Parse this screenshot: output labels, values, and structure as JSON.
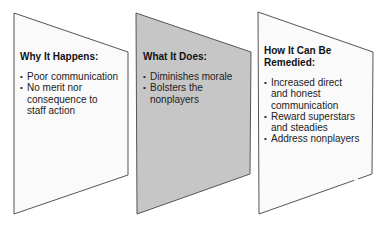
{
  "diagram": {
    "colors": {
      "panel_light_fill": "#fafafa",
      "panel_dark_fill": "#c6c6c6",
      "outline": "#555555"
    },
    "panels": [
      {
        "heading": "Why It Happens:",
        "bullets": [
          "Poor communication",
          "No merit nor consequence to staff action"
        ]
      },
      {
        "heading": "What It Does:",
        "bullets": [
          "Diminishes morale",
          "Bolsters the nonplayers"
        ]
      },
      {
        "heading": "How It Can Be Remedied:",
        "bullets": [
          "Increased direct and honest communication",
          "Reward superstars and steadies",
          "Address nonplayers"
        ]
      }
    ]
  }
}
